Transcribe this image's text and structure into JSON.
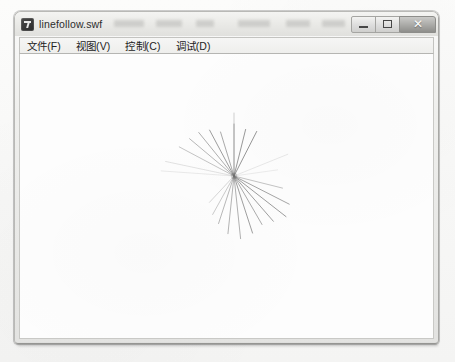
{
  "window": {
    "title": "linefollow.swf",
    "icon": "flash-player-icon",
    "controls": {
      "minimize_label": "–",
      "maximize_label": "□",
      "close_label": "✕"
    },
    "title_smudges": [
      {
        "left": 4,
        "width": 30
      },
      {
        "left": 46,
        "width": 26
      },
      {
        "left": 86,
        "width": 18
      },
      {
        "left": 128,
        "width": 32
      },
      {
        "left": 176,
        "width": 24
      },
      {
        "left": 212,
        "width": 26
      }
    ]
  },
  "menu": {
    "items": [
      {
        "name": "menu-file",
        "label": "文件(F)"
      },
      {
        "name": "menu-view",
        "label": "视图(V)"
      },
      {
        "name": "menu-control",
        "label": "控制(C)"
      },
      {
        "name": "menu-debug",
        "label": "调试(D)"
      }
    ]
  },
  "stage": {
    "background_color": "#fdfdfd",
    "line_color": "#6e6e6e",
    "origin": {
      "x": 234,
      "y": 177
    },
    "description": "radial starburst of thin lines converging at a point",
    "lines": [
      {
        "angle_deg": -90,
        "length": 52,
        "opacity": 0.62,
        "width": 0.9
      },
      {
        "angle_deg": -90,
        "length": 63,
        "opacity": 0.4,
        "width": 0.8
      },
      {
        "angle_deg": -76,
        "length": 48,
        "opacity": 0.7,
        "width": 1.0
      },
      {
        "angle_deg": -63,
        "length": 50,
        "opacity": 0.72,
        "width": 1.0
      },
      {
        "angle_deg": -107,
        "length": 46,
        "opacity": 0.66,
        "width": 0.9
      },
      {
        "angle_deg": -118,
        "length": 52,
        "opacity": 0.68,
        "width": 1.0
      },
      {
        "angle_deg": -129,
        "length": 56,
        "opacity": 0.62,
        "width": 0.9
      },
      {
        "angle_deg": -140,
        "length": 58,
        "opacity": 0.55,
        "width": 0.9
      },
      {
        "angle_deg": -152,
        "length": 62,
        "opacity": 0.5,
        "width": 0.8
      },
      {
        "angle_deg": -168,
        "length": 70,
        "opacity": 0.28,
        "width": 0.7
      },
      {
        "angle_deg": -176,
        "length": 73,
        "opacity": 0.2,
        "width": 0.7
      },
      {
        "angle_deg": -22,
        "length": 58,
        "opacity": 0.22,
        "width": 0.7
      },
      {
        "angle_deg": -8,
        "length": 44,
        "opacity": 0.18,
        "width": 0.7
      },
      {
        "angle_deg": 14,
        "length": 50,
        "opacity": 0.45,
        "width": 0.9
      },
      {
        "angle_deg": 27,
        "length": 62,
        "opacity": 0.62,
        "width": 1.0
      },
      {
        "angle_deg": 38,
        "length": 66,
        "opacity": 0.68,
        "width": 1.0
      },
      {
        "angle_deg": 49,
        "length": 60,
        "opacity": 0.66,
        "width": 1.0
      },
      {
        "angle_deg": 60,
        "length": 56,
        "opacity": 0.64,
        "width": 0.9
      },
      {
        "angle_deg": 72,
        "length": 60,
        "opacity": 0.66,
        "width": 1.0
      },
      {
        "angle_deg": 84,
        "length": 63,
        "opacity": 0.6,
        "width": 0.9
      },
      {
        "angle_deg": 96,
        "length": 58,
        "opacity": 0.58,
        "width": 0.9
      },
      {
        "angle_deg": 108,
        "length": 50,
        "opacity": 0.55,
        "width": 0.9
      },
      {
        "angle_deg": 119,
        "length": 44,
        "opacity": 0.45,
        "width": 0.8
      },
      {
        "angle_deg": 133,
        "length": 36,
        "opacity": 0.35,
        "width": 0.8
      }
    ]
  }
}
